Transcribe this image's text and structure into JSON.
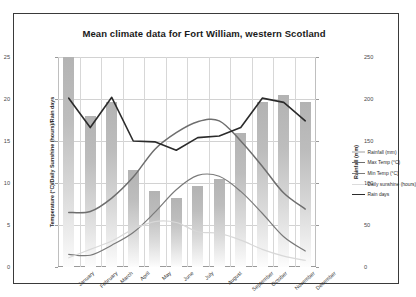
{
  "chart_data": {
    "type": "bar",
    "title": "Mean climate data for Fort William, western Scotland",
    "categories": [
      "January",
      "February",
      "March",
      "April",
      "May",
      "June",
      "July",
      "August",
      "September",
      "October",
      "November",
      "December"
    ],
    "xlabel": "",
    "ylabel": "Temperature (°C)/Daily Sunshine (hours)/Rain days",
    "ylabel_right": "Rainfall (mm)",
    "ylim": [
      0,
      25
    ],
    "ylim_right": [
      0,
      250
    ],
    "yticks": [
      0,
      5,
      10,
      15,
      20,
      25
    ],
    "yticks_right": [
      0,
      50,
      100,
      150,
      200,
      250
    ],
    "grid": true,
    "legend_position": "right",
    "series": [
      {
        "name": "Rainfall (mm)",
        "type": "bar",
        "axis": "right",
        "color": "#bdbdbd",
        "values": [
          250,
          180,
          196,
          115,
          90,
          82,
          96,
          105,
          160,
          196,
          205,
          197
        ]
      },
      {
        "name": "Max Temp (°C)",
        "type": "line",
        "axis": "left",
        "color": "#6e6e6e",
        "values": [
          6.5,
          6.6,
          8.2,
          10.7,
          14.0,
          16.0,
          17.3,
          17.4,
          15.0,
          12.0,
          8.8,
          6.9
        ]
      },
      {
        "name": "Min Temp (°C)",
        "type": "line",
        "axis": "left",
        "color": "#7a7a7a",
        "values": [
          1.5,
          1.4,
          2.6,
          4.1,
          6.5,
          9.2,
          10.9,
          10.8,
          9.0,
          6.4,
          3.6,
          1.9
        ]
      },
      {
        "name": "Daily sunshine (hours)",
        "type": "line",
        "axis": "left",
        "color": "#d8d8d8",
        "values": [
          1.1,
          2.1,
          3.1,
          4.5,
          5.4,
          5.3,
          4.2,
          4.0,
          3.2,
          2.1,
          1.3,
          0.8
        ]
      },
      {
        "name": "Rain days",
        "type": "line",
        "axis": "left",
        "color": "#2b2b2b",
        "values": [
          20.1,
          16.6,
          20.2,
          15.0,
          14.9,
          13.9,
          15.4,
          15.6,
          16.6,
          20.1,
          19.6,
          17.4
        ]
      }
    ]
  },
  "legend": {
    "items": [
      {
        "label": "Rainfall (mm)",
        "color": "#cfcfcf",
        "width": "2.2px"
      },
      {
        "label": "Max Temp (°C)",
        "color": "#6e6e6e",
        "width": "1.6px"
      },
      {
        "label": "Min Temp (°C)",
        "color": "#7a7a7a",
        "width": "1.3px"
      },
      {
        "label": "Daily sunshine (hours)",
        "color": "#dcdcdc",
        "width": "1.2px"
      },
      {
        "label": "Rain days",
        "color": "#2b2b2b",
        "width": "1.6px"
      }
    ]
  }
}
